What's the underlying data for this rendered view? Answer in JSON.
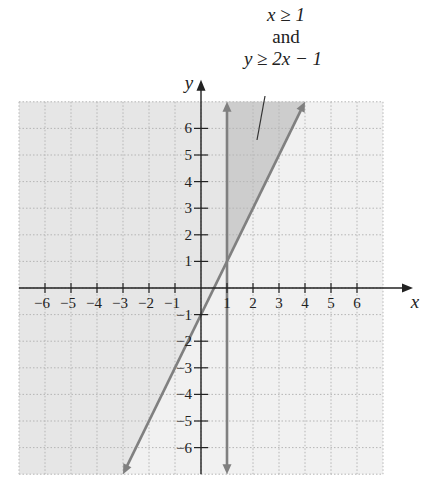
{
  "annotation": {
    "line1": "x ≥ 1",
    "line2": "and",
    "line3": "y ≥ 2x − 1"
  },
  "colors": {
    "shade_light": "#e6e6e6",
    "shade_dark": "#cdcdcd",
    "grid_bg": "#f1f1f1",
    "boundary_line": "#808080",
    "axis": "#222222",
    "grid_line": "#b5b5b5"
  },
  "chart_data": {
    "type": "inequality_region",
    "title": "x ≥ 1 and y ≥ 2x − 1",
    "xlabel": "x",
    "ylabel": "y",
    "xlim": [
      -7,
      7
    ],
    "ylim": [
      -7,
      7
    ],
    "x_ticks": [
      -6,
      -5,
      -4,
      -3,
      -2,
      -1,
      1,
      2,
      3,
      4,
      5,
      6
    ],
    "y_ticks": [
      -6,
      -5,
      -4,
      -3,
      -2,
      -1,
      1,
      2,
      3,
      4,
      5,
      6
    ],
    "grid": true,
    "lines": [
      {
        "name": "x = 1",
        "equation": "x = 1",
        "style": "solid",
        "arrows": "both"
      },
      {
        "name": "y = 2x − 1",
        "equation": "y = 2x - 1",
        "slope": 2,
        "intercept": -1,
        "style": "solid",
        "arrows": "both",
        "endpoints": [
          [
            -3,
            -7
          ],
          [
            4,
            7
          ]
        ]
      }
    ],
    "shaded_regions": [
      {
        "name": "y ≥ 2x − 1",
        "description": "region above/left of y = 2x − 1",
        "shade": "light"
      },
      {
        "name": "x ≥ 1 and y ≥ 2x − 1",
        "description": "intersection region, vertices (1,1), (1,7), (4,7)",
        "shade": "dark"
      }
    ],
    "annotations": [
      {
        "text": "x ≥ 1 and y ≥ 2x − 1",
        "points_to": [
          2,
          6
        ]
      }
    ]
  },
  "axis_labels": {
    "x": "x",
    "y": "y"
  }
}
